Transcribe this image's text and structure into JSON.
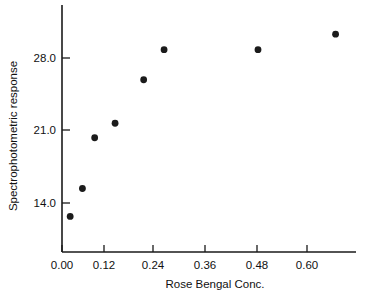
{
  "chart_data": {
    "type": "scatter",
    "title": "",
    "xlabel": "Rose Bengal Conc.",
    "ylabel": "Spectrophotometric response",
    "xlim": [
      0.0,
      0.72
    ],
    "ylim": [
      11.0,
      31.5
    ],
    "xticks": [
      "0.00",
      "0.12",
      "0.24",
      "0.36",
      "0.48",
      "0.60"
    ],
    "xtick_values": [
      0.0,
      0.12,
      0.24,
      0.36,
      0.48,
      0.6
    ],
    "yticks": [
      "14.0",
      "21.0",
      "28.0"
    ],
    "ytick_values": [
      14.0,
      21.0,
      28.0
    ],
    "grid": false,
    "legend": null,
    "marker": "filled-circle",
    "marker_color": "#1b1b1b",
    "x": [
      0.02,
      0.05,
      0.08,
      0.13,
      0.2,
      0.25,
      0.48,
      0.67
    ],
    "y": [
      12.7,
      15.4,
      20.3,
      21.7,
      25.9,
      28.8,
      28.8,
      30.3
    ],
    "points": [
      {
        "conc": 0.02,
        "response": 12.7
      },
      {
        "conc": 0.05,
        "response": 15.4
      },
      {
        "conc": 0.08,
        "response": 20.3
      },
      {
        "conc": 0.13,
        "response": 21.7
      },
      {
        "conc": 0.2,
        "response": 25.9
      },
      {
        "conc": 0.25,
        "response": 28.8
      },
      {
        "conc": 0.48,
        "response": 28.8
      },
      {
        "conc": 0.67,
        "response": 30.3
      }
    ]
  },
  "axes": {
    "x_title": "Rose Bengal Conc.",
    "y_title": "Spectrophotometric response",
    "x_tick_labels": [
      "0.00",
      "0.12",
      "0.24",
      "0.36",
      "0.48",
      "0.60"
    ],
    "y_tick_labels": [
      "28.0",
      "21.0",
      "14.0"
    ]
  }
}
